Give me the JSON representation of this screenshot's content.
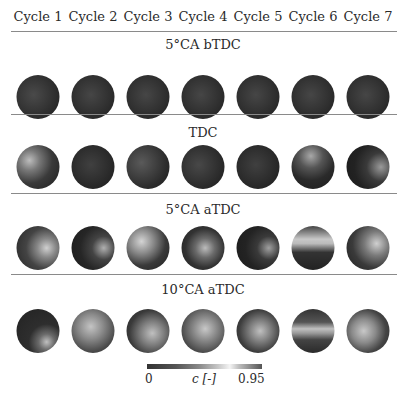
{
  "columns": [
    "Cycle 1",
    "Cycle 2",
    "Cycle 3",
    "Cycle 4",
    "Cycle 5",
    "Cycle 6",
    "Cycle 7"
  ],
  "rows": [
    {
      "label": "5°CA bTDC"
    },
    {
      "label": "TDC"
    },
    {
      "label": "5°CA aTDC"
    },
    {
      "label": "10°CA aTDC"
    }
  ],
  "colorbar": {
    "min_label": "0",
    "var_label": "c [-]",
    "max_label": "0.95"
  }
}
